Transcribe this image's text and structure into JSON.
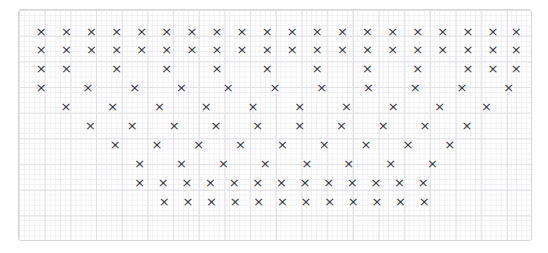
{
  "figure": {
    "background_color": "#ffffff",
    "panel_border_color": "#d8d8d8",
    "grid_minor_color": "#f0f0f2",
    "grid_major_color": "#e2e2e6",
    "marker_color": "#3a3a42",
    "marker_glyph": "×",
    "marker_symbol_name": "cross-x-marker"
  },
  "chart_data": {
    "type": "scatter",
    "title": "",
    "subtitle": "",
    "xlabel": "",
    "ylabel": "",
    "xlim": [
      0,
      100
    ],
    "ylim": [
      0,
      100
    ],
    "xticklabels": [],
    "yticklabels": [],
    "grid": true,
    "grid_style": "graph-paper (minor + major rules)",
    "legend": false,
    "legend_position": "none",
    "annotations": [],
    "marker": "x",
    "point_count": 125,
    "rows": [
      {
        "row": 1,
        "y": 95,
        "count": 20,
        "x": [
          2.5,
          7.6,
          12.7,
          17.8,
          22.9,
          28.0,
          33.1,
          38.2,
          43.3,
          48.4,
          53.5,
          58.6,
          63.7,
          68.8,
          73.9,
          79.0,
          84.1,
          89.2,
          94.3,
          99.0
        ]
      },
      {
        "row": 2,
        "y": 86,
        "count": 20,
        "x": [
          2.5,
          7.6,
          12.7,
          17.8,
          22.9,
          28.0,
          33.1,
          38.2,
          43.3,
          48.4,
          53.5,
          58.6,
          63.7,
          68.8,
          73.9,
          79.0,
          84.1,
          89.2,
          94.3,
          99.0
        ]
      },
      {
        "row": 3,
        "y": 77,
        "count": 12,
        "x": [
          2.5,
          7.6,
          17.8,
          28.0,
          38.2,
          48.4,
          58.6,
          68.8,
          79.0,
          89.2,
          94.3,
          99.0
        ]
      },
      {
        "row": 4,
        "y": 68,
        "count": 11,
        "x": [
          2.5,
          12.0,
          21.5,
          31.0,
          40.5,
          50.0,
          59.5,
          69.0,
          78.5,
          88.0,
          97.5
        ]
      },
      {
        "row": 5,
        "y": 59,
        "count": 10,
        "x": [
          7.5,
          17.0,
          26.5,
          36.0,
          45.5,
          55.0,
          64.5,
          74.0,
          83.5,
          93.0
        ]
      },
      {
        "row": 6,
        "y": 50,
        "count": 10,
        "x": [
          12.5,
          21.0,
          29.5,
          38.0,
          46.5,
          55.0,
          63.5,
          72.0,
          80.5,
          89.0
        ]
      },
      {
        "row": 7,
        "y": 41,
        "count": 9,
        "x": [
          17.5,
          26.0,
          34.5,
          43.0,
          51.5,
          60.0,
          68.5,
          77.0,
          85.5
        ]
      },
      {
        "row": 8,
        "y": 32,
        "count": 8,
        "x": [
          22.5,
          31.0,
          39.5,
          48.0,
          56.5,
          65.0,
          73.5,
          82.0
        ]
      },
      {
        "row": 9,
        "y": 23,
        "count": 13,
        "x": [
          22.5,
          27.3,
          32.1,
          36.9,
          41.7,
          46.5,
          51.3,
          56.1,
          60.9,
          65.7,
          70.5,
          75.3,
          80.1
        ]
      },
      {
        "row": 10,
        "y": 14,
        "count": 12,
        "x": [
          27.5,
          32.3,
          37.1,
          41.9,
          46.7,
          51.5,
          56.3,
          61.1,
          65.9,
          70.7,
          75.5,
          80.3
        ]
      }
    ]
  }
}
